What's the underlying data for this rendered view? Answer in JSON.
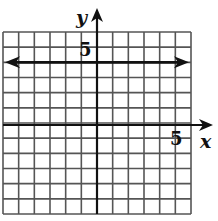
{
  "chart_data": {
    "type": "line",
    "title": "",
    "xlabel": "x",
    "ylabel": "y",
    "xlim": [
      -6,
      6
    ],
    "ylim": [
      -6,
      6
    ],
    "grid": true,
    "grid_step": 1,
    "tick_labels": {
      "x": [
        "5"
      ],
      "y": [
        "5"
      ]
    },
    "series": [
      {
        "name": "horizontal line",
        "equation": "y = 4",
        "x": [
          -6,
          6
        ],
        "y": [
          4,
          4
        ],
        "arrows": "both ends"
      }
    ]
  },
  "labels": {
    "x_axis": "x",
    "y_axis": "y",
    "x_tick": "5",
    "y_tick": "5"
  },
  "colors": {
    "grid": "#555555",
    "axis": "#111111",
    "line": "#111111",
    "background": "#ffffff"
  }
}
